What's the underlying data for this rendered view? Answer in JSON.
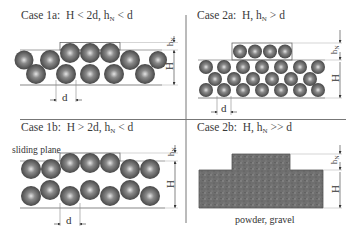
{
  "panels": [
    {
      "id": "case-1a",
      "title": "Case 1a:",
      "condition_main": "H < 2d, h",
      "condition_sub": "N",
      "condition_tail": " < d",
      "labels": {
        "d": "d",
        "H": "H",
        "hN": "h",
        "hN_sub": "N"
      }
    },
    {
      "id": "case-2a",
      "title": "Case 2a:",
      "condition_main": "H, h",
      "condition_sub": "N",
      "condition_tail": " > d",
      "labels": {
        "d": "d",
        "H": "H",
        "hN": "h",
        "hN_sub": "N"
      }
    },
    {
      "id": "case-1b",
      "title": "Case 1b:",
      "condition_main": "H > 2d, h",
      "condition_sub": "N",
      "condition_tail": " < d",
      "annotation": "sliding plane",
      "labels": {
        "d": "d",
        "H": "H",
        "hN": "h",
        "hN_sub": "N"
      }
    },
    {
      "id": "case-2b",
      "title": "Case 2b:",
      "condition_main": "H, h",
      "condition_sub": "N",
      "condition_tail": " >> d",
      "caption": "powder, gravel",
      "labels": {
        "H": "H",
        "hN": "h",
        "hN_sub": "N"
      }
    }
  ],
  "colors": {
    "sphere_dark": "#4a4a4a",
    "sphere_light": "#d8d8d8",
    "line": "#888888",
    "gravel": "#6e6e6e",
    "divider": "#777777"
  }
}
